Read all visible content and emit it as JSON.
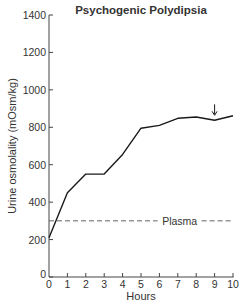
{
  "chart_data": {
    "type": "line",
    "title": "Psychogenic Polydipsia",
    "xlabel": "Hours",
    "ylabel": "Urine osmolality (mOsm/kg)",
    "x": [
      0,
      1,
      2,
      3,
      4,
      5,
      6,
      7,
      8,
      9,
      10
    ],
    "series": [
      {
        "name": "Urine osmolality",
        "values": [
          210,
          450,
          550,
          550,
          655,
          795,
          810,
          848,
          855,
          838,
          862
        ]
      }
    ],
    "reference_lines": [
      {
        "label": "Plasma",
        "y": 300,
        "style": "dashed"
      }
    ],
    "annotations": [
      {
        "type": "arrow-down",
        "x": 9,
        "y": 880
      }
    ],
    "xlim": [
      0,
      10
    ],
    "ylim": [
      0,
      1400
    ],
    "xticks": [
      "0",
      "1",
      "2",
      "3",
      "4",
      "5",
      "6",
      "7",
      "8",
      "9",
      "10"
    ],
    "yticks": [
      "0",
      "200",
      "400",
      "600",
      "800",
      "1000",
      "1200",
      "1400"
    ],
    "grid": false,
    "legend": "none"
  },
  "colors": {
    "line": "#1a1a1a",
    "plasma": "#666666",
    "axis": "#444444",
    "text": "#333333"
  }
}
